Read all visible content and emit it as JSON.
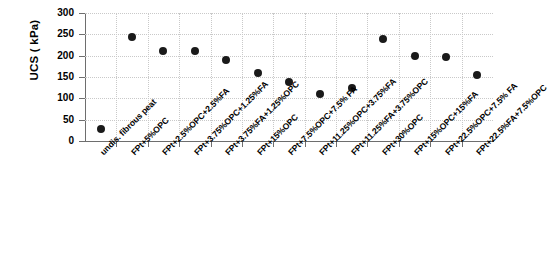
{
  "chart_data": {
    "type": "scatter",
    "title": "",
    "xlabel": "",
    "ylabel": "UCS ( kPa)",
    "ylim": [
      0,
      300
    ],
    "yticks": [
      0,
      50,
      100,
      150,
      200,
      250,
      300
    ],
    "grid": true,
    "legend": false,
    "marker": "filled-circle",
    "marker_color": "#1a1a1a",
    "categories": [
      "undis. fibrous peat",
      "FPt+5%OPC",
      "FPt+2.5%OPC+2.5%FA",
      "FPt+3.75%OPC+1.25%FA",
      "FPt+3.75%FA+1.25%OPC",
      "FPt+15%OPC",
      "FPt+7.5%OPC+7.5% FA",
      "FPt+11.25%OPC+3.75%FA",
      "FPt+11.25%FA+3.75%OPC",
      "FPt+30%OPC",
      "FPt+15%OPC+15%FA",
      "FPt+22.5%OPC+7.5% FA",
      "FPt+22.5%FA+7.5%OPC"
    ],
    "values": [
      29,
      244,
      211,
      210,
      190,
      160,
      138,
      109,
      124,
      239,
      200,
      196,
      155
    ]
  },
  "axis": {
    "y_title": "UCS ( kPa)",
    "y_tick_labels": [
      "300",
      "250",
      "200",
      "150",
      "100",
      "50",
      "0"
    ]
  }
}
